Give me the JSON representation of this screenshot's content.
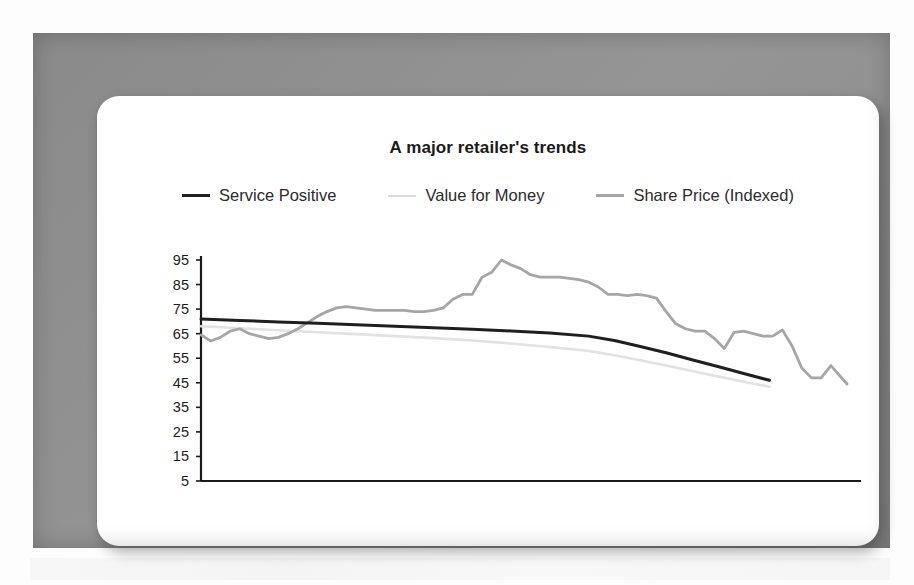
{
  "chart_data": {
    "type": "line",
    "title": "A major retailer's trends",
    "xlabel": "",
    "ylabel": "",
    "grid": false,
    "legend_position": "top-center",
    "ylim": [
      5,
      95
    ],
    "yticks": [
      95,
      85,
      75,
      65,
      55,
      45,
      35,
      25,
      15,
      5
    ],
    "xticks": [
      "Nov 95",
      "Mar 98",
      "Sep 99"
    ],
    "xtick_positions": [
      0,
      0.5,
      0.87
    ],
    "series": [
      {
        "name": "Service Positive",
        "color": "#1f1f1f",
        "width": 3.0,
        "x": [
          0.0,
          0.06,
          0.12,
          0.18,
          0.24,
          0.3,
          0.36,
          0.42,
          0.48,
          0.54,
          0.6,
          0.64,
          0.68,
          0.72,
          0.76,
          0.8,
          0.84,
          0.88
        ],
        "values": [
          71.0,
          70.4,
          69.8,
          69.2,
          68.6,
          68.0,
          67.4,
          66.8,
          66.1,
          65.3,
          64.0,
          62.2,
          59.8,
          57.2,
          54.4,
          51.6,
          48.8,
          46.0
        ]
      },
      {
        "name": "Value for Money",
        "color": "#e2e2e2",
        "width": 2.6,
        "x": [
          0.0,
          0.06,
          0.12,
          0.18,
          0.24,
          0.3,
          0.36,
          0.42,
          0.48,
          0.54,
          0.6,
          0.64,
          0.68,
          0.72,
          0.76,
          0.8,
          0.84,
          0.88
        ],
        "values": [
          68.0,
          67.2,
          66.4,
          65.6,
          64.8,
          64.0,
          63.2,
          62.2,
          61.0,
          59.6,
          58.0,
          56.2,
          54.2,
          52.0,
          49.8,
          47.6,
          45.4,
          43.4
        ]
      },
      {
        "name": "Share Price (Indexed)",
        "color": "#a6a6a6",
        "width": 2.8,
        "x": [
          0.0,
          0.015,
          0.03,
          0.045,
          0.06,
          0.075,
          0.09,
          0.105,
          0.12,
          0.135,
          0.15,
          0.165,
          0.18,
          0.195,
          0.21,
          0.225,
          0.24,
          0.255,
          0.27,
          0.285,
          0.3,
          0.315,
          0.33,
          0.345,
          0.36,
          0.375,
          0.39,
          0.405,
          0.42,
          0.435,
          0.45,
          0.465,
          0.48,
          0.495,
          0.51,
          0.525,
          0.54,
          0.555,
          0.57,
          0.585,
          0.6,
          0.615,
          0.63,
          0.645,
          0.66,
          0.675,
          0.69,
          0.705,
          0.72,
          0.735,
          0.75,
          0.765,
          0.78,
          0.795,
          0.81,
          0.825,
          0.84,
          0.855,
          0.87,
          0.885,
          0.9,
          0.915,
          0.93,
          0.945,
          0.96,
          0.975,
          1.0
        ],
        "values": [
          64.5,
          62.0,
          63.5,
          66.0,
          67.0,
          65.0,
          64.0,
          63.0,
          63.5,
          65.0,
          67.0,
          69.5,
          72.0,
          74.0,
          75.5,
          76.0,
          75.5,
          75.0,
          74.5,
          74.5,
          74.5,
          74.5,
          74.0,
          74.0,
          74.5,
          75.5,
          79.0,
          81.0,
          81.0,
          88.0,
          90.0,
          95.0,
          93.0,
          91.5,
          89.0,
          88.0,
          88.0,
          88.0,
          87.5,
          87.0,
          86.0,
          84.0,
          81.0,
          81.0,
          80.5,
          81.0,
          80.5,
          79.5,
          74.0,
          69.0,
          67.0,
          66.0,
          66.0,
          63.0,
          59.0,
          65.5,
          66.0,
          65.0,
          64.0,
          64.0,
          66.5,
          60.0,
          51.0,
          47.0,
          47.0,
          52.0,
          44.5
        ]
      }
    ]
  },
  "legend": [
    {
      "label": "Service Positive",
      "color": "#1f1f1f",
      "thickness": 3
    },
    {
      "label": "Value for Money",
      "color": "#dcdcdc",
      "thickness": 2
    },
    {
      "label": "Share Price (Indexed)",
      "color": "#a6a6a6",
      "thickness": 2.5
    }
  ],
  "axes": {
    "axis_color": "#1c1c1c",
    "y_labels": [
      "95",
      "85",
      "75",
      "65",
      "55",
      "45",
      "35",
      "25",
      "15",
      "5"
    ],
    "x_labels": [
      "Nov 95",
      "Mar 98",
      "Sep 99"
    ]
  },
  "colors": {
    "frame": "#8e8e8e",
    "card": "#ffffff",
    "page": "#fdfdfd",
    "text": "#1a1a1a"
  }
}
